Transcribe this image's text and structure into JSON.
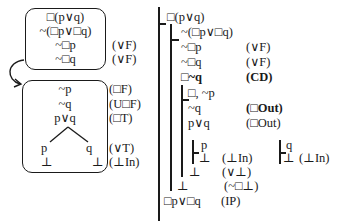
{
  "left_diagram": {
    "top_box": {
      "lines": [
        "□(p∨q)",
        "~(□p∨□q)",
        "~□p",
        "~□q"
      ],
      "justifications": [
        "",
        "",
        "(∨F)",
        "(∨F)"
      ]
    },
    "bottom_box": {
      "lines": [
        "~p",
        "~q",
        "p∨q"
      ],
      "justifications": [
        "(□F)",
        "(U□F)",
        "(□T)"
      ],
      "branches": {
        "left": [
          "p",
          "⊥"
        ],
        "right": [
          "q",
          "⊥"
        ],
        "justifications": [
          "(∨T)",
          "(⊥In)"
        ]
      }
    },
    "arrow": "curved-arrow-from-top-box-to-bottom-box"
  },
  "right_diagram": {
    "lines": [
      {
        "formula": "□(p∨q)",
        "just": ""
      },
      {
        "formula": "~(□p∨□q)",
        "just": ""
      },
      {
        "formula": "~□p",
        "just": "(∨F)"
      },
      {
        "formula": "~□q",
        "just": "(∨F)"
      },
      {
        "formula": "□~q",
        "just": "(CD)",
        "bold": true
      },
      {
        "formula": "□, ~p",
        "just": ""
      },
      {
        "formula": "~q",
        "just": "(□Out)",
        "just_bold": true
      },
      {
        "formula": "p∨q",
        "just": "(□Out)"
      },
      {
        "formula": "p",
        "just": ""
      },
      {
        "formula": "⊥",
        "just": "(⊥In)"
      },
      {
        "formula": "q",
        "just": ""
      },
      {
        "formula": "⊥",
        "just": "(⊥In)"
      },
      {
        "formula": "⊥",
        "just": "(∨⊥)"
      },
      {
        "formula": "⊥",
        "just": "(~□⊥)"
      },
      {
        "formula": "□p∨□q",
        "just": "(IP)"
      }
    ]
  }
}
